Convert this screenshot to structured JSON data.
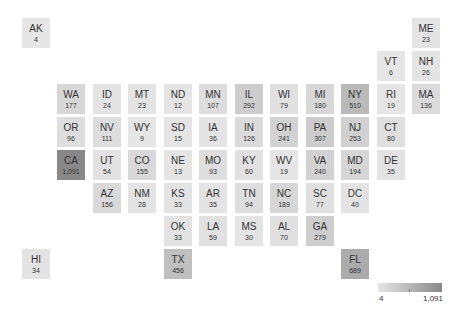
{
  "chart_data": {
    "type": "heatmap",
    "subtype": "tile-grid-map",
    "title": "",
    "legend": {
      "min_label": "4",
      "max_label": "1,091",
      "min": 4,
      "max": 1091,
      "color_low": "#e6e6e6",
      "color_high": "#888888",
      "position": "bottom-right"
    },
    "tiles": [
      {
        "state": "AK",
        "value": 4,
        "label": "4",
        "col": -1,
        "row": -2
      },
      {
        "state": "ME",
        "value": 23,
        "label": "23",
        "col": 10,
        "row": -2
      },
      {
        "state": "VT",
        "value": 6,
        "label": "6",
        "col": 9,
        "row": -1
      },
      {
        "state": "NH",
        "value": 26,
        "label": "26",
        "col": 10,
        "row": -1
      },
      {
        "state": "WA",
        "value": 177,
        "label": "177",
        "col": 0,
        "row": 0
      },
      {
        "state": "ID",
        "value": 24,
        "label": "24",
        "col": 1,
        "row": 0
      },
      {
        "state": "MT",
        "value": 23,
        "label": "23",
        "col": 2,
        "row": 0
      },
      {
        "state": "ND",
        "value": 12,
        "label": "12",
        "col": 3,
        "row": 0
      },
      {
        "state": "MN",
        "value": 107,
        "label": "107",
        "col": 4,
        "row": 0
      },
      {
        "state": "IL",
        "value": 292,
        "label": "292",
        "col": 5,
        "row": 0
      },
      {
        "state": "WI",
        "value": 79,
        "label": "79",
        "col": 6,
        "row": 0
      },
      {
        "state": "MI",
        "value": 180,
        "label": "180",
        "col": 7,
        "row": 0
      },
      {
        "state": "NY",
        "value": 510,
        "label": "510",
        "col": 8,
        "row": 0
      },
      {
        "state": "RI",
        "value": 19,
        "label": "19",
        "col": 9,
        "row": 0
      },
      {
        "state": "MA",
        "value": 136,
        "label": "136",
        "col": 10,
        "row": 0
      },
      {
        "state": "OR",
        "value": 96,
        "label": "96",
        "col": 0,
        "row": 1
      },
      {
        "state": "NV",
        "value": 111,
        "label": "111",
        "col": 1,
        "row": 1
      },
      {
        "state": "WY",
        "value": 9,
        "label": "9",
        "col": 2,
        "row": 1
      },
      {
        "state": "SD",
        "value": 15,
        "label": "15",
        "col": 3,
        "row": 1
      },
      {
        "state": "IA",
        "value": 36,
        "label": "36",
        "col": 4,
        "row": 1
      },
      {
        "state": "IN",
        "value": 126,
        "label": "126",
        "col": 5,
        "row": 1
      },
      {
        "state": "OH",
        "value": 241,
        "label": "241",
        "col": 6,
        "row": 1
      },
      {
        "state": "PA",
        "value": 307,
        "label": "307",
        "col": 7,
        "row": 1
      },
      {
        "state": "NJ",
        "value": 253,
        "label": "253",
        "col": 8,
        "row": 1
      },
      {
        "state": "CT",
        "value": 80,
        "label": "80",
        "col": 9,
        "row": 1
      },
      {
        "state": "CA",
        "value": 1091,
        "label": "1,091",
        "col": 0,
        "row": 2
      },
      {
        "state": "UT",
        "value": 54,
        "label": "54",
        "col": 1,
        "row": 2
      },
      {
        "state": "CO",
        "value": 155,
        "label": "155",
        "col": 2,
        "row": 2
      },
      {
        "state": "NE",
        "value": 13,
        "label": "13",
        "col": 3,
        "row": 2
      },
      {
        "state": "MO",
        "value": 93,
        "label": "93",
        "col": 4,
        "row": 2
      },
      {
        "state": "KY",
        "value": 60,
        "label": "60",
        "col": 5,
        "row": 2
      },
      {
        "state": "WV",
        "value": 19,
        "label": "19",
        "col": 6,
        "row": 2
      },
      {
        "state": "VA",
        "value": 240,
        "label": "240",
        "col": 7,
        "row": 2
      },
      {
        "state": "MD",
        "value": 194,
        "label": "194",
        "col": 8,
        "row": 2
      },
      {
        "state": "DE",
        "value": 35,
        "label": "35",
        "col": 9,
        "row": 2
      },
      {
        "state": "AZ",
        "value": 156,
        "label": "156",
        "col": 1,
        "row": 3
      },
      {
        "state": "NM",
        "value": 28,
        "label": "28",
        "col": 2,
        "row": 3
      },
      {
        "state": "KS",
        "value": 33,
        "label": "33",
        "col": 3,
        "row": 3
      },
      {
        "state": "AR",
        "value": 35,
        "label": "35",
        "col": 4,
        "row": 3
      },
      {
        "state": "TN",
        "value": 94,
        "label": "94",
        "col": 5,
        "row": 3
      },
      {
        "state": "NC",
        "value": 189,
        "label": "189",
        "col": 6,
        "row": 3
      },
      {
        "state": "SC",
        "value": 77,
        "label": "77",
        "col": 7,
        "row": 3
      },
      {
        "state": "DC",
        "value": 40,
        "label": "40",
        "col": 8,
        "row": 3
      },
      {
        "state": "OK",
        "value": 33,
        "label": "33",
        "col": 3,
        "row": 4
      },
      {
        "state": "LA",
        "value": 59,
        "label": "59",
        "col": 4,
        "row": 4
      },
      {
        "state": "MS",
        "value": 30,
        "label": "30",
        "col": 5,
        "row": 4
      },
      {
        "state": "AL",
        "value": 70,
        "label": "70",
        "col": 6,
        "row": 4
      },
      {
        "state": "GA",
        "value": 279,
        "label": "279",
        "col": 7,
        "row": 4
      },
      {
        "state": "HI",
        "value": 34,
        "label": "34",
        "col": -1,
        "row": 5
      },
      {
        "state": "TX",
        "value": 456,
        "label": "456",
        "col": 3,
        "row": 5
      },
      {
        "state": "FL",
        "value": 689,
        "label": "689",
        "col": 8,
        "row": 5
      }
    ]
  },
  "legend": {
    "min_label": "4",
    "max_label": "1,091"
  }
}
